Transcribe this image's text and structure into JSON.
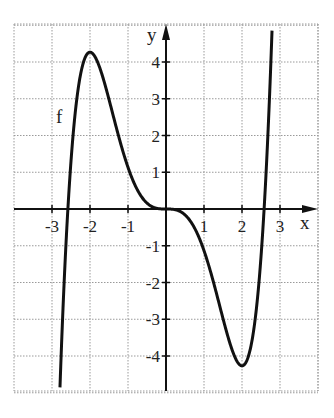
{
  "chart_data": {
    "type": "line",
    "title": "",
    "xlabel": "x",
    "ylabel": "y",
    "xlim": [
      -4,
      4
    ],
    "ylim": [
      -5,
      5
    ],
    "grid": true,
    "x_ticks": [
      -3,
      -2,
      -1,
      1,
      2,
      3
    ],
    "y_ticks": [
      -4,
      -3,
      -2,
      -1,
      1,
      2,
      3,
      4
    ],
    "x_tick_labels": [
      "-3",
      "-2",
      "-1",
      "1",
      "2",
      "3"
    ],
    "y_tick_labels": [
      "-4",
      "-3",
      "-2",
      "-1",
      "1",
      "2",
      "3",
      "4"
    ],
    "series": [
      {
        "name": "f",
        "formula_approx": "f(x) = 0.2x^5 - (4/3)x^3",
        "x": [
          -2.8,
          -2.6,
          -2.5,
          -2.4,
          -2.2,
          -2.0,
          -1.8,
          -1.6,
          -1.4,
          -1.2,
          -1.0,
          -0.8,
          -0.6,
          -0.4,
          -0.2,
          0,
          0.2,
          0.4,
          0.6,
          0.8,
          1.0,
          1.2,
          1.4,
          1.6,
          1.8,
          2.0,
          2.2,
          2.4,
          2.5,
          2.6,
          2.8
        ],
        "y": [
          -5.0,
          -0.0,
          1.3,
          2.5,
          3.8,
          4.27,
          3.9,
          3.4,
          2.6,
          1.8,
          1.13,
          0.62,
          0.27,
          0.08,
          0.01,
          0,
          -0.01,
          -0.08,
          -0.27,
          -0.62,
          -1.13,
          -1.8,
          -2.6,
          -3.4,
          -3.9,
          -4.27,
          -3.8,
          -2.5,
          -1.3,
          0.0,
          5.0
        ]
      }
    ],
    "annotations": [
      {
        "text": "f",
        "x": -2.75,
        "y": 2.5
      }
    ],
    "extrema": [
      {
        "type": "local max",
        "x": -2,
        "y": 4.27
      },
      {
        "type": "local min",
        "x": 2,
        "y": -4.27
      },
      {
        "type": "saddle",
        "x": 0,
        "y": 0
      }
    ]
  },
  "labels": {
    "x_axis": "x",
    "y_axis": "y",
    "curve_name": "f"
  }
}
